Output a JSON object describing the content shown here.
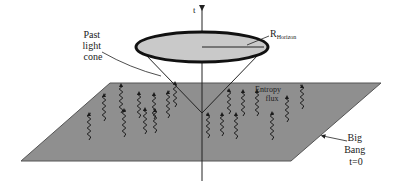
{
  "diagram": {
    "axis_label": "t",
    "horizon_label_main": "R",
    "horizon_label_sub": "Horizon",
    "past_light_cone_label": [
      "Past",
      "light",
      "cone"
    ],
    "entropy_flux_label": [
      "Entropy",
      "flux"
    ],
    "big_bang_label": [
      "Big",
      "Bang",
      "t=0"
    ]
  },
  "colors": {
    "plane_fill": "#8f8f8f",
    "plane_edge": "#555555",
    "disk_fill": "#c9c9c9",
    "disk_edge": "#111111",
    "line": "#222222",
    "wave": "#1a1a1a"
  },
  "geometry": {
    "plane": {
      "top_left": [
        110,
        83
      ],
      "top_right": [
        381,
        83
      ],
      "bottom_right": [
        291,
        161
      ],
      "bottom_left": [
        21,
        161
      ]
    },
    "axis": {
      "x": 202,
      "y_top": 8,
      "y_bottom": 181
    },
    "disk": {
      "cx": 202,
      "cy": 47,
      "rx": 66,
      "ry": 15
    },
    "cone_apex": [
      202,
      113
    ]
  },
  "entropy_arrows": [
    {
      "x": 121,
      "y_top": 84,
      "len": 29
    },
    {
      "x": 104,
      "y_top": 94,
      "len": 27
    },
    {
      "x": 89,
      "y_top": 113,
      "len": 27
    },
    {
      "x": 124,
      "y_top": 109,
      "len": 28
    },
    {
      "x": 139,
      "y_top": 92,
      "len": 26
    },
    {
      "x": 145,
      "y_top": 108,
      "len": 26
    },
    {
      "x": 154,
      "y_top": 93,
      "len": 26
    },
    {
      "x": 155,
      "y_top": 109,
      "len": 24
    },
    {
      "x": 168,
      "y_top": 91,
      "len": 27
    },
    {
      "x": 175,
      "y_top": 82,
      "len": 25
    },
    {
      "x": 208,
      "y_top": 113,
      "len": 25
    },
    {
      "x": 222,
      "y_top": 113,
      "len": 23
    },
    {
      "x": 229,
      "y_top": 89,
      "len": 25
    },
    {
      "x": 236,
      "y_top": 113,
      "len": 26
    },
    {
      "x": 243,
      "y_top": 90,
      "len": 26
    },
    {
      "x": 257,
      "y_top": 90,
      "len": 26
    },
    {
      "x": 272,
      "y_top": 112,
      "len": 28
    },
    {
      "x": 287,
      "y_top": 96,
      "len": 26
    },
    {
      "x": 302,
      "y_top": 85,
      "len": 24
    }
  ]
}
